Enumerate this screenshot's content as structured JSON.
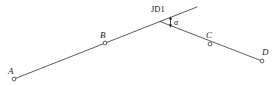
{
  "figure": {
    "type": "surveying-route-deflection-angle-diagram",
    "background_color": "#ffffff",
    "line_color": "#4a4a4a",
    "marker_fill": "#ffffff",
    "marker_stroke": "#3a3a3a",
    "text_color": "#1a1a1a",
    "width": 278,
    "height": 86
  },
  "labels": {
    "point_a": "A",
    "point_b": "B",
    "point_c": "C",
    "point_d": "D",
    "vertex": "JD1",
    "angle": "α"
  },
  "geometry": {
    "points": [
      {
        "name": "A",
        "x": 14,
        "y": 79,
        "label_x": 8,
        "label_y": 73
      },
      {
        "name": "B",
        "x": 105,
        "y": 43,
        "label_x": 100,
        "label_y": 38
      },
      {
        "name": "JD1",
        "x": 160,
        "y": 21.5,
        "label_x": 152,
        "label_y": 11
      },
      {
        "name": "C",
        "x": 210,
        "y": 44,
        "label_x": 207,
        "label_y": 37
      },
      {
        "name": "D",
        "x": 262,
        "y": 61,
        "label_x": 263,
        "label_y": 54
      }
    ],
    "back_tangent": {
      "x1": 14,
      "y1": 79,
      "x2": 160,
      "y2": 21.5
    },
    "forward_tangent": {
      "x1": 160,
      "y1": 21.5,
      "x2": 262,
      "y2": 61
    },
    "extension": {
      "x1": 160,
      "y1": 21.5,
      "x2": 197,
      "y2": 7
    },
    "angle_arrow": {
      "x": 170.5,
      "y_top": 17.5,
      "y_bottom": 26.5
    },
    "angle_label_pos": {
      "x": 174,
      "y": 24
    },
    "marker_radius": 1.9
  }
}
